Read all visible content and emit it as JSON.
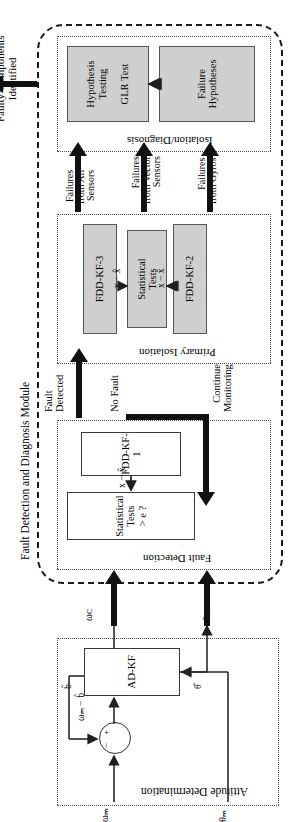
{
  "figure": {
    "orientation": "rotated-90-ccw",
    "output_arrow_label": "Faulty Components\nIdentified",
    "outer_module_label": "Fault Detection and Diagnosis Module"
  },
  "attitude_determination": {
    "title": "Attitude Determination",
    "inputs": [
      {
        "name": "omega-m-input",
        "label": "ωₘ"
      },
      {
        "name": "theta-m-input",
        "label": "θₘ"
      }
    ],
    "sum_junction": {
      "minus": "−",
      "plus": "+"
    },
    "signals": {
      "bias_corrected": "ωₘ − b̂",
      "bias_estimate": "b̂",
      "attitude_estimate": "θ̂"
    },
    "filter_block": "AD-KF",
    "outputs": [
      {
        "name": "omega-c-output",
        "label": "ωᴄ"
      },
      {
        "name": "theta-m-output",
        "label": "θₘ"
      }
    ]
  },
  "fault_detection": {
    "title": "Fault Detection",
    "blocks": [
      {
        "name": "fdd-kf-1",
        "label": "FDD-KF-1",
        "fill": "white"
      },
      {
        "name": "statistical-tests-detection",
        "label": "Statistical\nTests\n> e ?",
        "fill": "white"
      }
    ],
    "residual_label": "x − x̂",
    "branch_labels": {
      "no_fault": "No Fault",
      "continue_monitoring": "Continue\nMonitoring",
      "fault_detected": "Fault\nDetected"
    }
  },
  "primary_isolation": {
    "title": "Primary Isolation",
    "blocks": [
      {
        "name": "fdd-kf-2",
        "label": "FDD-KF-2",
        "fill": "gray"
      },
      {
        "name": "statistical-tests-isolation",
        "label": "Statistical\nTests",
        "fill": "gray"
      },
      {
        "name": "fdd-kf-3",
        "label": "FDD-KF-3",
        "fill": "gray"
      }
    ],
    "residual_left": "x − x̂",
    "residual_right": "x − x̂"
  },
  "failure_arrows": [
    {
      "name": "failures-from-gyros",
      "label": "Failures\nfrom Gyros"
    },
    {
      "name": "failures-from-vector-sensors",
      "label": "Failures\nfrom Vector\nSensors"
    },
    {
      "name": "failures-from-all-sensors",
      "label": "Failures\nfrom All\nSensors"
    }
  ],
  "isolation_diagnosis": {
    "title": "Isolation/Diagnosis",
    "blocks": [
      {
        "name": "failure-hypotheses",
        "label": "Failure\nHypotheses",
        "fill": "gray"
      },
      {
        "name": "hypothesis-testing-glr",
        "label": "Hypothesis\nTesting\n\nGLR Test",
        "fill": "gray"
      }
    ]
  },
  "colors": {
    "block_fill_gray": "#cfcfcf",
    "block_fill_white": "#ffffff",
    "stroke": "#2a2a2a",
    "dashed_outline": "#1a1a1a"
  }
}
